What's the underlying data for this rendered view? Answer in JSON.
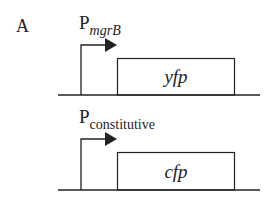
{
  "panel_label": "A",
  "constructs": [
    {
      "promoter": {
        "letter": "P",
        "subscript": "mgrB",
        "subscript_italic": true
      },
      "gene": "yfp"
    },
    {
      "promoter": {
        "letter": "P",
        "subscript": "constitutive",
        "subscript_italic": false
      },
      "gene": "cfp"
    }
  ],
  "colors": {
    "line": "#222222",
    "background": "#ffffff"
  }
}
